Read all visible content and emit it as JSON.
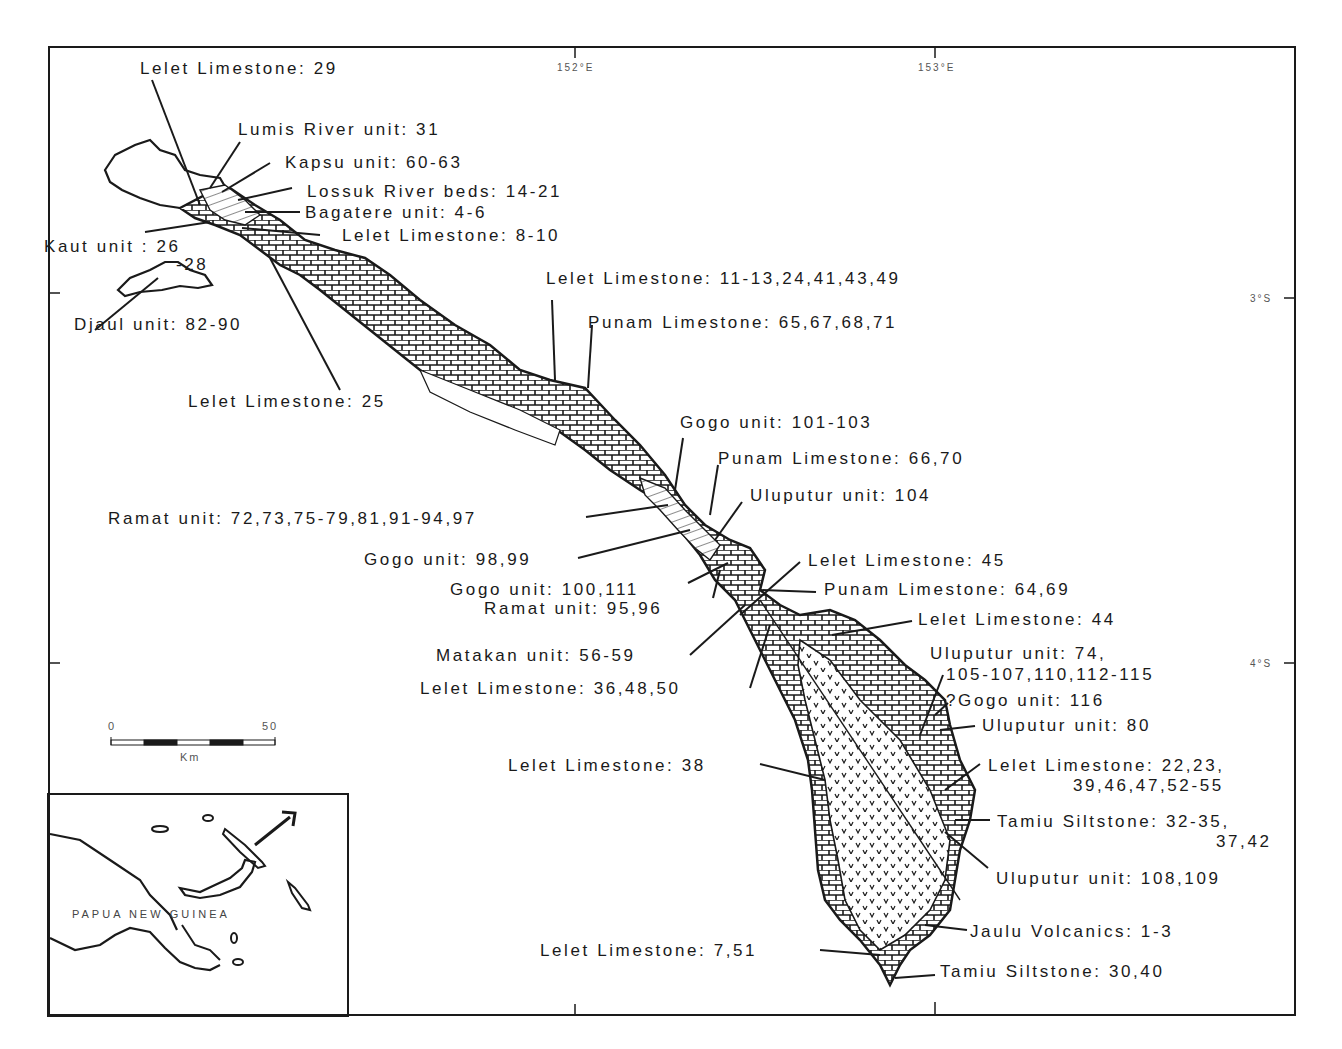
{
  "map": {
    "longitude_ticks": [
      "152°E",
      "153°E"
    ],
    "latitude_ticks": [
      "3°S",
      "4°S"
    ],
    "scale_bar": {
      "start": "0",
      "end": "50",
      "unit": "Km"
    },
    "inset": {
      "country_label": "PAPUA NEW GUINEA",
      "arrow": "location-arrow"
    },
    "labels": [
      {
        "id": "l1",
        "text": "Lelet Limestone: 29"
      },
      {
        "id": "l2",
        "text": "Lumis River unit: 31"
      },
      {
        "id": "l3",
        "text": "Kapsu unit: 60-63"
      },
      {
        "id": "l4",
        "text": "Lossuk River beds: 14-21"
      },
      {
        "id": "l5",
        "text": "Bagatere unit: 4-6"
      },
      {
        "id": "l6",
        "text": "Lelet Limestone: 8-10"
      },
      {
        "id": "l7",
        "text": "Kaut unit : 26"
      },
      {
        "id": "l7b",
        "text": "-28"
      },
      {
        "id": "l8",
        "text": "Djaul unit: 82-90"
      },
      {
        "id": "l9",
        "text": "Lelet Limestone: 25"
      },
      {
        "id": "l10",
        "text": "Lelet Limestone: 11-13,24,41,43,49"
      },
      {
        "id": "l11",
        "text": "Punam Limestone: 65,67,68,71"
      },
      {
        "id": "l12",
        "text": "Gogo unit: 101-103"
      },
      {
        "id": "l13",
        "text": "Punam Limestone: 66,70"
      },
      {
        "id": "l14",
        "text": "Uluputur unit: 104"
      },
      {
        "id": "l15",
        "text": "Ramat unit: 72,73,75-79,81,91-94,97"
      },
      {
        "id": "l16",
        "text": "Gogo unit: 98,99"
      },
      {
        "id": "l17",
        "text": "Lelet Limestone: 45"
      },
      {
        "id": "l18",
        "text": "Gogo unit: 100,111"
      },
      {
        "id": "l19",
        "text": "Punam Limestone: 64,69"
      },
      {
        "id": "l20",
        "text": "Ramat unit: 95,96"
      },
      {
        "id": "l21",
        "text": "Lelet Limestone: 44"
      },
      {
        "id": "l22",
        "text": "Matakan unit: 56-59"
      },
      {
        "id": "l23",
        "text": "Uluputur unit: 74,"
      },
      {
        "id": "l23b",
        "text": "105-107,110,112-115"
      },
      {
        "id": "l24",
        "text": "Lelet Limestone: 36,48,50"
      },
      {
        "id": "l25",
        "text": "?Gogo unit: 116"
      },
      {
        "id": "l26",
        "text": "Uluputur unit: 80"
      },
      {
        "id": "l27",
        "text": "Lelet Limestone: 38"
      },
      {
        "id": "l28",
        "text": "Lelet Limestone: 22,23,"
      },
      {
        "id": "l28b",
        "text": "39,46,47,52-55"
      },
      {
        "id": "l29",
        "text": "Tamiu Siltstone: 32-35,"
      },
      {
        "id": "l29b",
        "text": "37,42"
      },
      {
        "id": "l30",
        "text": "Uluputur unit: 108,109"
      },
      {
        "id": "l31",
        "text": "Jaulu Volcanics: 1-3"
      },
      {
        "id": "l32",
        "text": "Lelet Limestone: 7,51"
      },
      {
        "id": "l33",
        "text": "Tamiu Siltstone: 30,40"
      }
    ]
  }
}
